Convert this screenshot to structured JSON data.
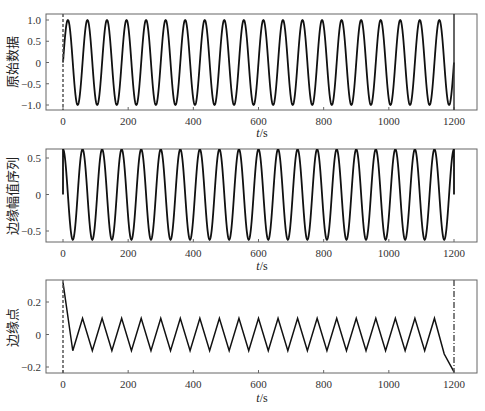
{
  "chart_data": [
    {
      "type": "line",
      "title": "",
      "ylabel": "原始数据",
      "xlabel": "t/s",
      "xlim": [
        -50,
        1270
      ],
      "ylim": [
        -1.1,
        1.1
      ],
      "xticks": [
        0,
        200,
        400,
        600,
        800,
        1000,
        1200
      ],
      "yticks": [
        1.0,
        0.5,
        0,
        -0.5,
        -1.0
      ],
      "ytick_labels": [
        "1.0",
        "0.5",
        "0",
        "−0.5",
        "−1.0"
      ],
      "grid": false,
      "series": [
        {
          "name": "signal",
          "kind": "sine",
          "amplitude": 1.0,
          "period": 60,
          "phase_peak_at": 15,
          "x_start": 0,
          "x_end": 1200,
          "color": "#111111"
        },
        {
          "name": "left-boundary",
          "kind": "vline-dashed",
          "x": 0,
          "color": "#555555"
        },
        {
          "name": "right-boundary",
          "kind": "vline",
          "x": 1200,
          "color": "#333333"
        }
      ]
    },
    {
      "type": "line",
      "title": "",
      "ylabel": "边缘幅值序列",
      "xlabel": "t/s",
      "xlim": [
        -50,
        1270
      ],
      "ylim": [
        -0.68,
        0.68
      ],
      "xticks": [
        0,
        200,
        400,
        600,
        800,
        1000,
        1200
      ],
      "yticks": [
        0.5,
        0,
        -0.5
      ],
      "ytick_labels": [
        "0.5",
        "0",
        "−0.5"
      ],
      "grid": false,
      "series": [
        {
          "name": "edge-amplitude",
          "kind": "sine",
          "amplitude": 0.62,
          "period": 60,
          "phase_peak_at": 0,
          "x_start": 0,
          "x_end": 1200,
          "start_value": 0,
          "end_value": 0,
          "color": "#111111"
        }
      ]
    },
    {
      "type": "line",
      "title": "",
      "ylabel": "边缘点",
      "xlabel": "t/s",
      "xlim": [
        -50,
        1270
      ],
      "ylim": [
        -0.24,
        0.34
      ],
      "xticks": [
        0,
        200,
        400,
        600,
        800,
        1000,
        1200
      ],
      "yticks": [
        0.2,
        0,
        -0.2
      ],
      "ytick_labels": [
        "0.2",
        "0",
        "−0.2"
      ],
      "grid": false,
      "series": [
        {
          "name": "edge-points",
          "kind": "polyline",
          "x": [
            0,
            30,
            60,
            90,
            120,
            150,
            180,
            210,
            240,
            270,
            300,
            330,
            360,
            390,
            420,
            450,
            480,
            510,
            540,
            570,
            600,
            630,
            660,
            690,
            720,
            750,
            780,
            810,
            840,
            870,
            900,
            930,
            960,
            990,
            1020,
            1050,
            1080,
            1110,
            1140,
            1170,
            1200
          ],
          "y": [
            0.32,
            -0.1,
            0.1,
            -0.1,
            0.1,
            -0.1,
            0.1,
            -0.1,
            0.1,
            -0.1,
            0.1,
            -0.1,
            0.1,
            -0.1,
            0.1,
            -0.1,
            0.1,
            -0.1,
            0.1,
            -0.1,
            0.1,
            -0.1,
            0.1,
            -0.1,
            0.1,
            -0.1,
            0.1,
            -0.1,
            0.1,
            -0.1,
            0.1,
            -0.1,
            0.1,
            -0.1,
            0.1,
            -0.1,
            0.1,
            -0.1,
            0.1,
            -0.12,
            -0.23
          ],
          "color": "#111111"
        },
        {
          "name": "left-boundary",
          "kind": "vline-dashed",
          "x": 0,
          "color": "#555555"
        },
        {
          "name": "right-boundary",
          "kind": "vline-dashdot",
          "x": 1200,
          "color": "#555555"
        }
      ]
    }
  ],
  "panels": [
    {
      "ylabel": "原始数据",
      "xlabel_t": "t",
      "xlabel_unit": "/s"
    },
    {
      "ylabel": "边缘幅值序列",
      "xlabel_t": "t",
      "xlabel_unit": "/s"
    },
    {
      "ylabel": "边缘点",
      "xlabel_t": "t",
      "xlabel_unit": "/s"
    }
  ],
  "xtick_labels": [
    "0",
    "200",
    "400",
    "600",
    "800",
    "1000",
    "1200"
  ]
}
